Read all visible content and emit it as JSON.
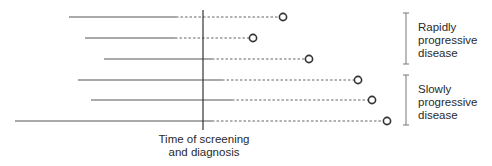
{
  "diagram": {
    "axis_label": [
      "Time of screening",
      "and diagnosis"
    ],
    "groups": [
      {
        "name": "rapid",
        "label": [
          "Rapidly",
          "progressive",
          "disease"
        ],
        "bracket": {
          "x": 406,
          "y1": 13,
          "y2": 64
        }
      },
      {
        "name": "slow",
        "label": [
          "Slowly",
          "progressive",
          "disease"
        ],
        "bracket": {
          "x": 406,
          "y1": 75,
          "y2": 125
        }
      }
    ],
    "screening_line": {
      "x": 203,
      "y1": 10,
      "y2": 130
    },
    "cases": [
      {
        "y": 17,
        "start": 69,
        "detectable": 176,
        "end": 283,
        "group": "rapid"
      },
      {
        "y": 38,
        "start": 85,
        "detectable": 175,
        "end": 253,
        "group": "rapid"
      },
      {
        "y": 59,
        "start": 104,
        "detectable": 212,
        "end": 309,
        "group": "rapid"
      },
      {
        "y": 80,
        "start": 78,
        "detectable": 222,
        "end": 358,
        "group": "slow"
      },
      {
        "y": 100,
        "start": 91,
        "detectable": 232,
        "end": 372,
        "group": "slow"
      },
      {
        "y": 121,
        "start": 15,
        "detectable": 212,
        "end": 387,
        "group": "slow"
      }
    ],
    "colors": {
      "line": "#555555",
      "dash": "#666666",
      "circle": "#333333",
      "bracket": "#777777"
    }
  }
}
